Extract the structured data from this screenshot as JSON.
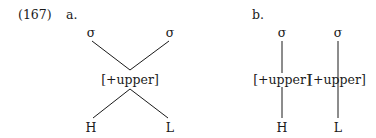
{
  "example": {
    "number": "(167)",
    "panels": [
      {
        "label": "a.",
        "syllables": [
          "σ",
          "σ"
        ],
        "feature": "[+upper]",
        "tones": [
          "H",
          "L"
        ]
      },
      {
        "label": "b.",
        "syllables": [
          "σ",
          "σ"
        ],
        "features": [
          "[+upper]",
          "[+upper]"
        ],
        "tones": [
          "H",
          "L"
        ]
      }
    ]
  }
}
